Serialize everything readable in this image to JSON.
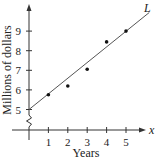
{
  "chart_data": {
    "type": "scatter",
    "title": "",
    "xlabel": "Years",
    "ylabel": "Millions of dollars",
    "x_axis_symbol": "x",
    "line_label": "L",
    "x_ticks": [
      "1",
      "2",
      "3",
      "4",
      "5"
    ],
    "y_ticks": [
      "5",
      "6",
      "7",
      "8",
      "9"
    ],
    "xlim": [
      0,
      5.5
    ],
    "ylim": [
      5,
      10
    ],
    "y_axis_break": true,
    "grid": false,
    "series": [
      {
        "name": "data points",
        "x": [
          1,
          2,
          3,
          4,
          5
        ],
        "y": [
          5.75,
          6.2,
          7.05,
          8.45,
          9.0
        ]
      }
    ],
    "trend_line": {
      "name": "L",
      "x": [
        0,
        6.2
      ],
      "y": [
        5.0,
        9.95
      ],
      "slope": 0.8,
      "intercept": 5.0
    }
  }
}
